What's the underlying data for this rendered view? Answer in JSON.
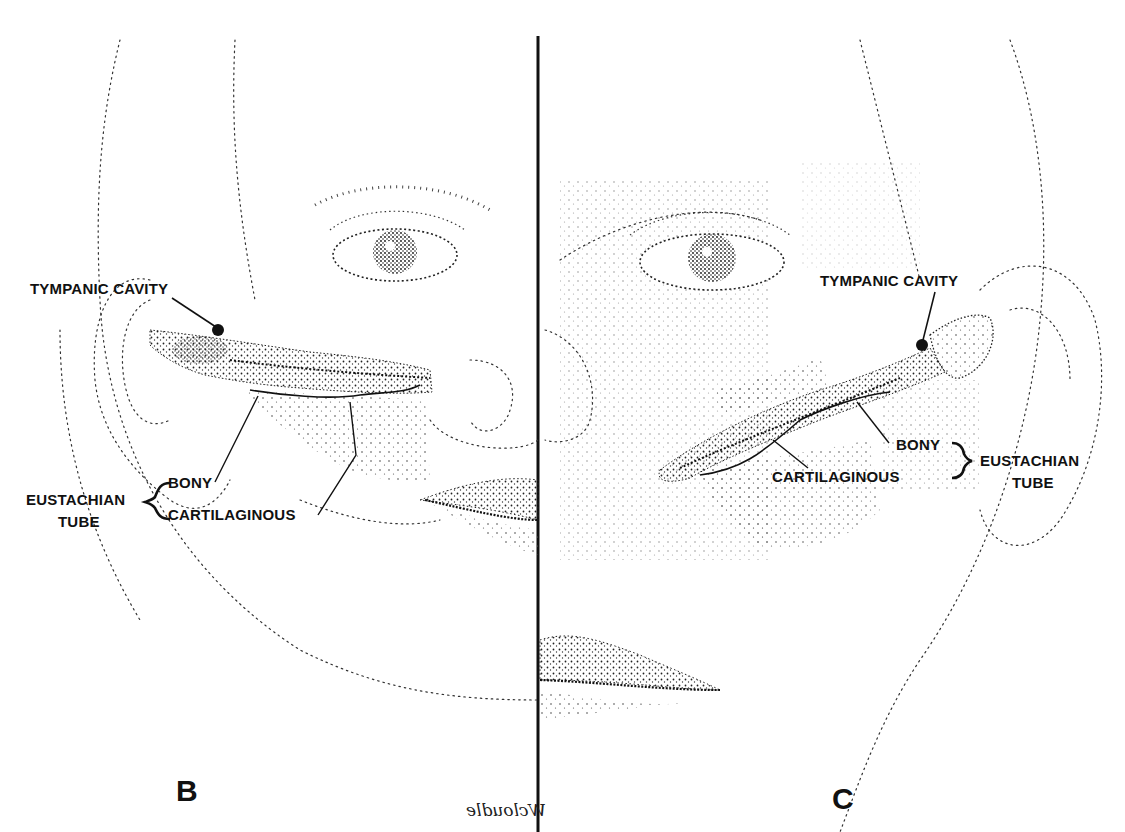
{
  "figure": {
    "panels": [
      {
        "letter": "B",
        "labels": {
          "tympanic_cavity": "TYMPANIC  CAVITY",
          "bony": "BONY",
          "cartilaginous": "CARTILAGINOUS",
          "eustachian": "EUSTACHIAN",
          "tube": "TUBE"
        }
      },
      {
        "letter": "C",
        "labels": {
          "tympanic_cavity": "TYMPANIC  CAVITY",
          "bony": "BONY",
          "cartilaginous": "CARTILAGINOUS",
          "eustachian": "EUSTACHIAN",
          "tube": "TUBE"
        }
      }
    ],
    "signature": "Wcloudle",
    "colors": {
      "ink": "#111111",
      "paper": "#ffffff",
      "stipple": "#333333"
    }
  }
}
